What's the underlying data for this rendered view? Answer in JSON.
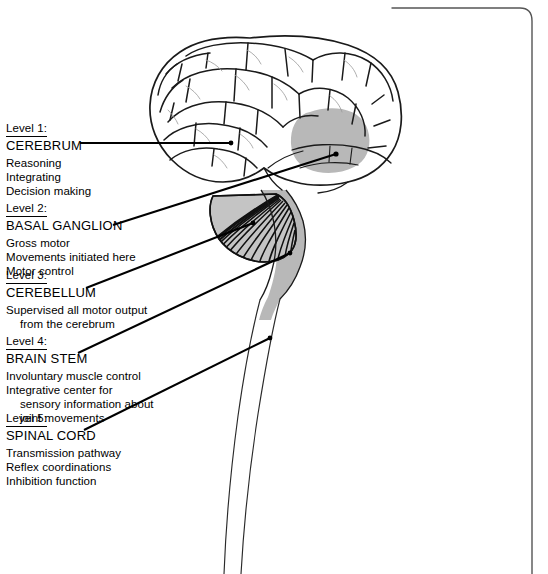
{
  "figure": {
    "bottom_caption": "",
    "colors": {
      "ink": "#000000",
      "shaded_structure": "#b8b8b8",
      "page_background": "#ffffff",
      "frame_line": "#555555"
    },
    "levels": [
      {
        "tag": "Level 1",
        "tag_colon": ":",
        "name": "CEREBRUM",
        "descriptions": [
          {
            "text": "Reasoning",
            "indent": false
          },
          {
            "text": "Integrating",
            "indent": false
          },
          {
            "text": "Decision making",
            "indent": false
          }
        ]
      },
      {
        "tag": "Level 2",
        "tag_colon": ":",
        "name": "BASAL GANGLION",
        "descriptions": [
          {
            "text": "Gross motor",
            "indent": false
          },
          {
            "text": "Movements initiated here",
            "indent": false
          },
          {
            "text": "Motor control",
            "indent": false
          }
        ]
      },
      {
        "tag": "Level 3",
        "tag_colon": ":",
        "name": "CEREBELLUM",
        "descriptions": [
          {
            "text": "Supervised all motor output",
            "indent": false
          },
          {
            "text": "from the cerebrum",
            "indent": true
          }
        ]
      },
      {
        "tag": "Level 4",
        "tag_colon": ":",
        "name": "BRAIN STEM",
        "descriptions": [
          {
            "text": "Involuntary muscle control",
            "indent": false
          },
          {
            "text": "Integrative center for",
            "indent": false
          },
          {
            "text": "sensory information about",
            "indent": true
          },
          {
            "text": "joint movements",
            "indent": true
          }
        ]
      },
      {
        "tag": "Level 5",
        "tag_colon": ":",
        "name": "SPINAL CORD",
        "descriptions": [
          {
            "text": "Transmission pathway",
            "indent": false
          },
          {
            "text": "Reflex coordinations",
            "indent": false
          },
          {
            "text": "Inhibition function",
            "indent": false
          }
        ]
      }
    ],
    "anatomy": [
      {
        "part": "cerebrum",
        "shading": "outline-gyri"
      },
      {
        "part": "basal-ganglion",
        "shading": "solid-gray"
      },
      {
        "part": "cerebellum",
        "shading": "fanned-hatching"
      },
      {
        "part": "brain-stem",
        "shading": "solid-gray"
      },
      {
        "part": "spinal-cord",
        "shading": "outline-only"
      }
    ]
  }
}
